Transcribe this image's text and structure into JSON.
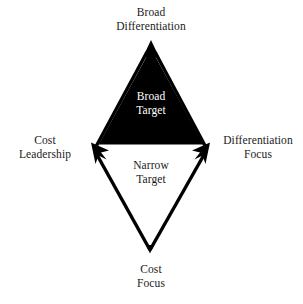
{
  "diagram": {
    "background_color": "#ffffff",
    "ink_color": "#000000",
    "triangle_fill": "#000000",
    "inner_light_text_color": "#ffffff",
    "outer_text_color": "#1a1a1a",
    "outer_labels": {
      "top": "Broad\nDifferentiation",
      "left": "Cost\nLeadership",
      "right": "Differentiation\nFocus",
      "bottom": "Cost\nFocus"
    },
    "inner_labels": {
      "upper": "Broad\nTarget",
      "lower": "Narrow\nTarget"
    },
    "geometry": {
      "apex_top": [
        151,
        41
      ],
      "vertex_left": [
        92,
        145
      ],
      "vertex_right": [
        209,
        145
      ],
      "apex_bottom": [
        150,
        252
      ]
    },
    "arrows": {
      "count": 4,
      "direction": "outward",
      "head_style": "solid-filled-barbed"
    }
  }
}
